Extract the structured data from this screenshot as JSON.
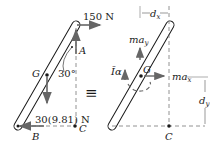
{
  "left_diagram": {
    "force_top": "150 N",
    "point_A": "A",
    "point_G": "G",
    "angle": "30°",
    "weight": "30(9.81) N",
    "point_B": "B",
    "point_C": "C"
  },
  "equiv_symbol": "≡",
  "right_diagram": {
    "dx_label": "d",
    "dx_sub": "x",
    "may_label": "ma",
    "may_sub": "y",
    "Ialpha_label": "Īα",
    "point_G": "G",
    "max_label": "ma",
    "max_sub": "x",
    "dy_label": "d",
    "dy_sub": "y",
    "point_C": "C"
  },
  "colors": {
    "line": "#1a1a1a",
    "arrow": "#666666",
    "dashed": "#777777"
  }
}
